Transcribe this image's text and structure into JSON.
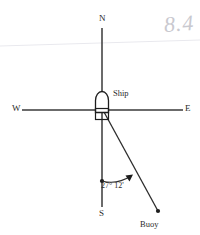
{
  "figure": {
    "kind": "navigation-bearing-diagram",
    "background_color": "#ffffff",
    "ink_color": "#2b2b2b",
    "scan_artifact_color": "#e6e6ea"
  },
  "compass": {
    "north_label": "N",
    "south_label": "S",
    "east_label": "E",
    "west_label": "W",
    "vertical_axis_x": 102,
    "vertical_axis_top_y": 28,
    "vertical_axis_bottom_y": 207,
    "horizontal_axis_y": 110,
    "horizontal_axis_left_x": 22,
    "horizontal_axis_right_x": 183
  },
  "ship": {
    "label": "Ship",
    "symbol": "ship-hull-symbol",
    "origin_x": 102,
    "origin_y": 112
  },
  "buoy": {
    "label": "Buoy",
    "point_x": 158,
    "point_y": 212
  },
  "bearing": {
    "angle_label": "27° 12'",
    "degrees": 27,
    "minutes": 12,
    "measured_from": "S",
    "measured_toward": "E",
    "vertex_x": 102,
    "vertex_y": 112,
    "arc_start_x": 102,
    "arc_start_y": 181,
    "arc_end_x": 134,
    "arc_end_y": 175
  },
  "annotation": {
    "handwriting": "8.4"
  }
}
